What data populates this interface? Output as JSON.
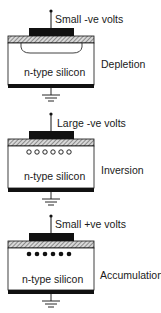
{
  "diagram": {
    "type": "MOS capacitor bias states",
    "panels": [
      {
        "id": "depletion",
        "bias_label": "Small -ve volts",
        "state_label": "Depletion",
        "substrate_label": "n-type silicon",
        "feature": "depletion-region",
        "carriers": 0
      },
      {
        "id": "inversion",
        "bias_label": "Large -ve volts",
        "state_label": "Inversion",
        "substrate_label": "n-type silicon",
        "feature": "holes",
        "carriers": 6
      },
      {
        "id": "accumulation",
        "bias_label": "Small +ve  volts",
        "state_label": "Accumulation",
        "substrate_label": "n-type silicon",
        "feature": "electrons",
        "carriers": 6
      }
    ],
    "colors": {
      "ink": "#111111",
      "background": "#ffffff",
      "oxide_hatch": "#555555"
    }
  }
}
